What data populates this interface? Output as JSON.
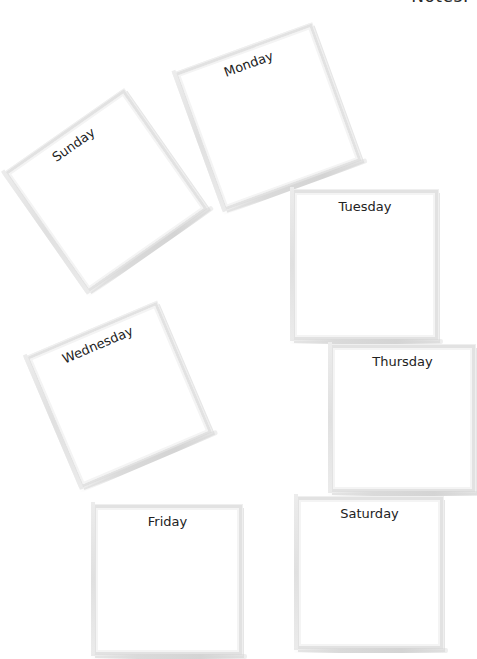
{
  "page": {
    "notes_title": "Notes:"
  },
  "days": [
    {
      "label": "Sunday"
    },
    {
      "label": "Monday"
    },
    {
      "label": "Tuesday"
    },
    {
      "label": "Wednesday"
    },
    {
      "label": "Thursday"
    },
    {
      "label": "Friday"
    },
    {
      "label": "Saturday"
    }
  ],
  "colors": {
    "background": "#ffffff",
    "frame_border": "#e2e2e2",
    "text": "#222222"
  }
}
